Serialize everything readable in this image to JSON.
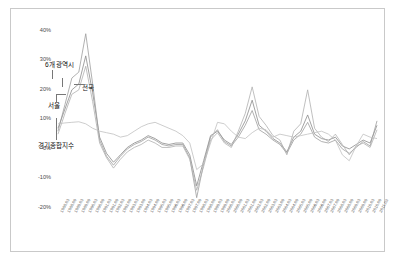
{
  "chart_data": {
    "type": "line",
    "title": "",
    "xlabel": "",
    "ylabel": "",
    "ylim": [
      -20,
      45
    ],
    "yticks": [
      40,
      30,
      20,
      10,
      0,
      -10,
      -20
    ],
    "ytick_labels": [
      "40%",
      "30%",
      "20%",
      "10%",
      "0%",
      "-10%",
      "-20%"
    ],
    "grid": false,
    "legend_position": "inline-annotations",
    "x": [
      "1988.03",
      "1988.09",
      "1989.03",
      "1989.09",
      "1990.03",
      "1990.09",
      "1991.03",
      "1991.09",
      "1992.03",
      "1992.09",
      "1993.03",
      "1993.09",
      "1994.03",
      "1994.09",
      "1995.03",
      "1995.09",
      "1996.03",
      "1996.09",
      "1997.03",
      "1997.09",
      "1998.03",
      "1998.09",
      "1999.03",
      "1999.09",
      "2000.03",
      "2000.09",
      "2001.03",
      "2001.09",
      "2002.03",
      "2002.09",
      "2003.03",
      "2003.09",
      "2004.03",
      "2004.09",
      "2005.03",
      "2005.09",
      "2006.03",
      "2006.09",
      "2007.03",
      "2007.09",
      "2008.03",
      "2008.09",
      "2009.03",
      "2009.09",
      "2010.03",
      "2010.09",
      "2011.03"
    ],
    "series": [
      {
        "name": "전국",
        "color": "#8a8a8a",
        "values": [
          7.0,
          13.5,
          20.0,
          22.0,
          31.5,
          19.0,
          4.0,
          -1.5,
          -4.5,
          -2.0,
          0.5,
          2.0,
          3.0,
          4.5,
          3.5,
          2.0,
          1.5,
          2.0,
          2.0,
          -2.0,
          -12.5,
          -4.0,
          4.5,
          6.0,
          3.0,
          1.5,
          5.0,
          9.5,
          16.5,
          8.0,
          6.0,
          3.5,
          2.0,
          -1.0,
          4.0,
          6.0,
          11.5,
          5.0,
          3.5,
          3.0,
          4.0,
          1.0,
          0.0,
          1.5,
          3.0,
          2.0,
          8.0
        ]
      },
      {
        "name": "6개 광역시",
        "color": "#9d9d9d",
        "values": [
          6.0,
          15.0,
          24.0,
          26.0,
          39.0,
          22.0,
          3.0,
          -2.5,
          -5.5,
          -2.5,
          0.0,
          1.5,
          2.5,
          4.0,
          3.0,
          1.5,
          1.0,
          1.5,
          1.5,
          -3.0,
          -16.5,
          -5.0,
          4.0,
          6.5,
          2.5,
          1.0,
          4.0,
          8.0,
          13.0,
          6.5,
          5.0,
          3.0,
          1.5,
          -1.5,
          3.0,
          5.0,
          9.0,
          4.0,
          2.5,
          2.0,
          3.0,
          0.0,
          -1.5,
          0.5,
          2.5,
          1.0,
          9.5
        ]
      },
      {
        "name": "서울",
        "color": "#b0b0b0",
        "values": [
          5.0,
          12.0,
          18.5,
          20.0,
          28.0,
          16.0,
          2.0,
          -3.0,
          -6.5,
          -3.5,
          -1.0,
          0.5,
          1.5,
          3.0,
          2.0,
          0.5,
          0.5,
          1.0,
          1.0,
          -3.5,
          -14.0,
          -6.0,
          3.0,
          5.5,
          2.0,
          0.5,
          6.0,
          12.0,
          21.0,
          11.0,
          8.0,
          4.5,
          3.0,
          -2.0,
          6.0,
          8.5,
          20.0,
          7.0,
          4.0,
          2.5,
          5.0,
          1.5,
          -2.0,
          1.0,
          2.0,
          0.5,
          6.5
        ]
      },
      {
        "name": "경기종합지수",
        "color": "#c0c0c0",
        "values": [
          8.5,
          8.8,
          9.0,
          9.2,
          8.5,
          7.0,
          6.0,
          5.5,
          5.0,
          4.0,
          4.5,
          6.0,
          7.5,
          8.5,
          9.0,
          8.0,
          7.0,
          6.0,
          4.5,
          2.0,
          -7.0,
          -5.0,
          2.0,
          9.0,
          8.5,
          6.0,
          4.0,
          3.5,
          5.5,
          7.0,
          6.5,
          4.0,
          5.0,
          4.5,
          4.0,
          4.5,
          5.0,
          5.5,
          6.0,
          5.0,
          3.0,
          -2.0,
          -4.0,
          1.0,
          5.0,
          4.0,
          3.5
        ]
      }
    ],
    "annotations": [
      {
        "text": "6개 광역시",
        "left": 45,
        "top": 59
      },
      {
        "text": "전국",
        "left": 82,
        "top": 82
      },
      {
        "text": "서울",
        "left": 48,
        "top": 100
      },
      {
        "text": "경기종합지수",
        "left": 38,
        "top": 140
      }
    ]
  }
}
